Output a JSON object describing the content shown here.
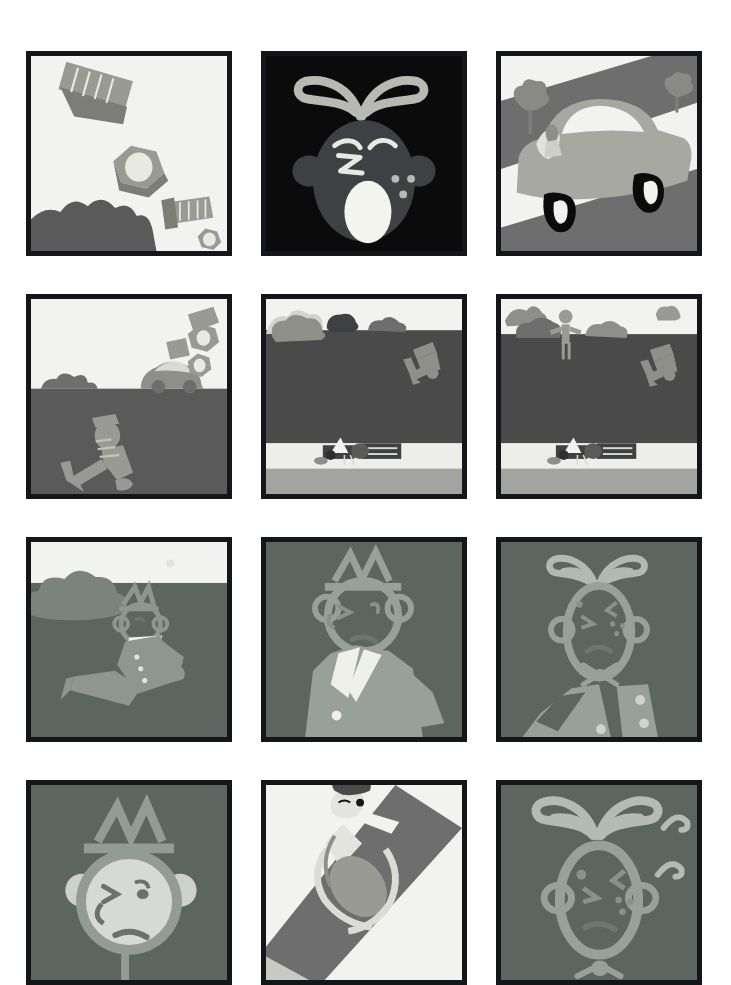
{
  "sheet": {
    "title": "Comic strip page",
    "format": "12-panel grid, 3 columns by 4 rows",
    "style": "flat grayscale vector cartoon",
    "background_color": "#ffffff",
    "panel_border_color": "#15161a",
    "panel_border_width_px": 5,
    "columns": 3,
    "rows": 4,
    "panel_count": 12
  },
  "palette": {
    "ink": "#15161a",
    "paper": "#ffffff",
    "sky_light": "#f2f2f0",
    "cream": "#e9e9e4",
    "ground_dark": "#4a4a4a",
    "ground_mid": "#5a5a5a",
    "ground_teal": "#5d6560",
    "road_gray": "#6e6e6e",
    "metal_light": "#b9b9b4",
    "metal_mid": "#9a9a95",
    "metal_dark": "#7d7d78",
    "skin_light": "#d8d8d2",
    "highlight": "#cfcfc9",
    "shadow": "#3a3a3a",
    "black": "#0b0b0c",
    "white": "#ffffff"
  },
  "panels": [
    {
      "index": 1,
      "row": 1,
      "col": 1,
      "name": "panel-nuts-and-bolts-falling",
      "caption": "Nuts and bolts tumble through a pale sky above a dark bush",
      "background": "#f2f2f0",
      "objects": [
        "large-bolt",
        "hex-nut",
        "small-bolt",
        "small-hex-nut",
        "tiny-bolt",
        "bush"
      ]
    },
    {
      "index": 2,
      "row": 1,
      "col": 2,
      "name": "panel-shouting-face-night",
      "caption": "Close-up of a shouting face on a black background",
      "background": "#0b0b0c",
      "objects": [
        "hair-swoosh",
        "head",
        "ears",
        "angry-eyes",
        "open-mouth",
        "sweat-drops"
      ]
    },
    {
      "index": 3,
      "row": 1,
      "col": 3,
      "name": "panel-car-on-road",
      "caption": "A car drives along a diagonal road between two trees",
      "background": "#f2f2f0",
      "objects": [
        "road-diagonal",
        "car-body",
        "windshield",
        "driver",
        "front-wheel",
        "rear-wheel",
        "tree-left",
        "tree-right"
      ]
    },
    {
      "index": 4,
      "row": 2,
      "col": 1,
      "name": "panel-figure-fallen-with-parts",
      "caption": "A figure sprawls on dark ground while car parts fly above the horizon",
      "background": "#f2f2f0",
      "objects": [
        "horizon",
        "distant-car",
        "falling-nuts",
        "bush",
        "fallen-figure",
        "flying-hat"
      ]
    },
    {
      "index": 5,
      "row": 2,
      "col": 2,
      "name": "panel-wide-landscape-wreck",
      "caption": "Wide shot: wrecked car on the road, figure tumbling on the dark field",
      "background": "#f2f2f0",
      "objects": [
        "sky",
        "clouds",
        "tree",
        "dark-field",
        "tumbling-figure",
        "wrecked-car",
        "road-strip"
      ]
    },
    {
      "index": 6,
      "row": 2,
      "col": 3,
      "name": "panel-wide-landscape-witness",
      "caption": "Same wide shot with a bystander standing on the horizon",
      "background": "#f2f2f0",
      "objects": [
        "sky",
        "clouds",
        "tree",
        "standing-bystander",
        "dark-field",
        "tumbling-figure",
        "wrecked-car",
        "road-strip"
      ]
    },
    {
      "index": 7,
      "row": 3,
      "col": 1,
      "name": "panel-man-sitting-on-ground",
      "caption": "A man in a suit and hat sits up on the dark ground beside a cloud",
      "background": "#5d6560",
      "objects": [
        "sky-band",
        "cloud",
        "sun-dot",
        "seated-man",
        "hat",
        "suit",
        "legs"
      ]
    },
    {
      "index": 8,
      "row": 3,
      "col": 2,
      "name": "panel-man-closeup-hat",
      "caption": "Close-up of the annoyed man with hat, hand on hip",
      "background": "#5d6560",
      "objects": [
        "hat",
        "head",
        "ears",
        "squint-eyes",
        "frown",
        "suit-lapels",
        "arm-on-hip",
        "button"
      ]
    },
    {
      "index": 9,
      "row": 3,
      "col": 3,
      "name": "panel-other-man-closeup",
      "caption": "Close-up of the other man with swooped hair and bow tie",
      "background": "#5d6560",
      "objects": [
        "hair-swoosh",
        "oval-head",
        "ears",
        "squint-eyes",
        "frown",
        "bow-tie",
        "arm",
        "buttons"
      ]
    },
    {
      "index": 10,
      "row": 4,
      "col": 1,
      "name": "panel-man-face-bottom-left",
      "caption": "Tight close-up of the hatted man's scowling face, cropped at panel bottom",
      "background": "#5d6560",
      "objects": [
        "hat",
        "round-head",
        "ears",
        "squint-eyes",
        "frown",
        "neck"
      ]
    },
    {
      "index": 11,
      "row": 4,
      "col": 2,
      "name": "panel-overhead-road-figure",
      "caption": "Overhead view of a figure lying across the striped road",
      "background": "#f2f2f0",
      "objects": [
        "diagonal-road",
        "lane-dashes",
        "prone-figure",
        "head",
        "arm",
        "torso"
      ]
    },
    {
      "index": 12,
      "row": 4,
      "col": 3,
      "name": "panel-other-man-face-bottom-right",
      "caption": "Tight close-up of the swoop-haired man's worried face with motion marks",
      "background": "#5d6560",
      "objects": [
        "hair-swoosh",
        "oval-head",
        "ears",
        "squint-eyes",
        "frown",
        "motion-marks",
        "bow-tie"
      ]
    }
  ]
}
